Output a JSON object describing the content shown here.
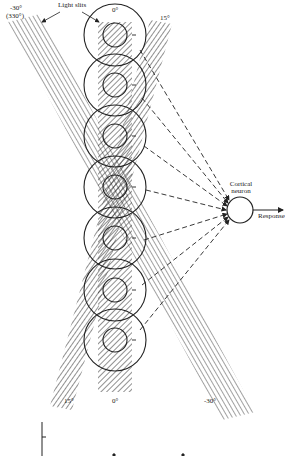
{
  "labels": {
    "light_slits": "Light slits",
    "top_left_angle": "-30°",
    "top_left_angle_alt": "(330°)",
    "top_center_angle": "0°",
    "top_right_angle": "15°",
    "cortical_neuron_line1": "Cortical",
    "cortical_neuron_line2": "neuron",
    "response": "Response",
    "bottom_left_angle": "15°",
    "bottom_center_angle": "0°",
    "bottom_right_angle": "-30°"
  },
  "receptive_fields": {
    "count": 7,
    "center_x": 115,
    "centers_y": [
      35,
      85,
      136,
      187,
      238,
      290,
      340
    ],
    "outer_radius": 31,
    "inner_radius": 12,
    "center_sign": "+",
    "surround_sign": "-"
  },
  "slits": [
    {
      "name": "0°",
      "orientation_deg": 0
    },
    {
      "name": "15°",
      "orientation_deg": 15
    },
    {
      "name": "-30°",
      "orientation_deg": -30
    }
  ],
  "neuron": {
    "cx": 240,
    "cy": 210,
    "r": 13
  },
  "colors": {
    "ink": "#222222",
    "background": "#ffffff"
  }
}
